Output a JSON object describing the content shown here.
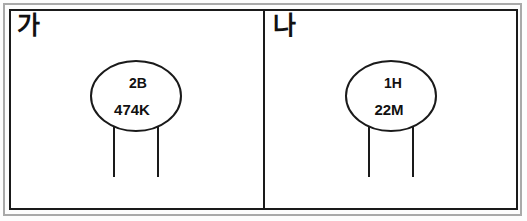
{
  "figure": {
    "type": "two-panel-diagram",
    "background_color": "#ffffff",
    "line_color": "#1a1a1a",
    "frame_color": "#a9a9a9"
  },
  "panels": [
    {
      "label": "가",
      "label_name": "panel-label-ga",
      "symbol": {
        "shape": "ellipse-with-two-legs",
        "text_top": "2B",
        "text_bottom": "474K",
        "leg_count": 2
      }
    },
    {
      "label": "나",
      "label_name": "panel-label-na",
      "symbol": {
        "shape": "ellipse-with-two-legs",
        "text_top": "1H",
        "text_bottom": "22M",
        "leg_count": 2
      }
    }
  ]
}
